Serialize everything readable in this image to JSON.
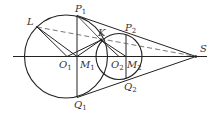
{
  "diagram": {
    "type": "geometry",
    "stroke_color": "#222222",
    "points": {
      "L": {
        "label": "L",
        "sub": "",
        "x": 37,
        "y": 27
      },
      "K": {
        "label": "K",
        "sub": "",
        "x": 101,
        "y": 40
      },
      "P1": {
        "label": "P",
        "sub": "1",
        "x": 77,
        "y": 15
      },
      "Q1": {
        "label": "Q",
        "sub": "1",
        "x": 77,
        "y": 98
      },
      "P2": {
        "label": "P",
        "sub": "2",
        "x": 126,
        "y": 34
      },
      "Q2": {
        "label": "Q",
        "sub": "2",
        "x": 126,
        "y": 78
      },
      "O1": {
        "label": "O",
        "sub": "1",
        "x": 67,
        "y": 56
      },
      "M1": {
        "label": "M",
        "sub": "1",
        "x": 77,
        "y": 56
      },
      "O2": {
        "label": "O",
        "sub": "2",
        "x": 119,
        "y": 56
      },
      "M2": {
        "label": "M",
        "sub": "2",
        "x": 126,
        "y": 56
      },
      "S": {
        "label": "S",
        "sub": "",
        "x": 196,
        "y": 56
      }
    },
    "circles": [
      {
        "name": "circle-O1",
        "cx": 66,
        "cy": 56.5,
        "r": 41.5
      },
      {
        "name": "circle-O2",
        "cx": 119,
        "cy": 56.5,
        "r": 23
      }
    ]
  }
}
